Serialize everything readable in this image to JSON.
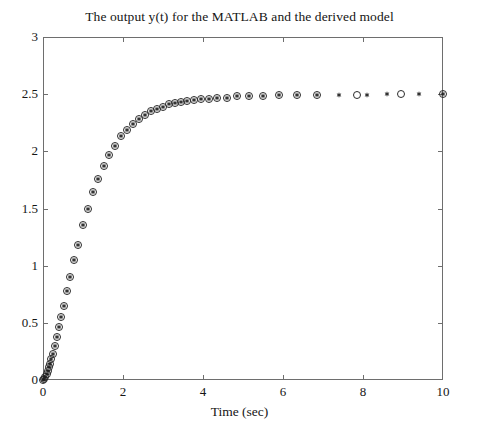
{
  "figure": {
    "background_color": "#ffffff",
    "axis_color": "#6e6e6e",
    "marker_color": "#2b2b2b"
  },
  "chart_data": {
    "type": "scatter",
    "title": "The output y(t) for the MATLAB and the derived model",
    "xlabel": "Time (sec)",
    "ylabel": "",
    "xlim": [
      0,
      10
    ],
    "ylim": [
      0,
      3
    ],
    "xticks": [
      0,
      2,
      4,
      6,
      8,
      10
    ],
    "xticklabels": [
      "0",
      "2",
      "4",
      "6",
      "8",
      "10"
    ],
    "yticks": [
      0,
      0.5,
      1,
      1.5,
      2,
      2.5,
      3
    ],
    "yticklabels": [
      "0",
      "0.5",
      "1",
      "1.5",
      "2",
      "2.5",
      "3"
    ],
    "grid": false,
    "legend": null,
    "legend_position": "none",
    "steady_state_value": 2.5,
    "series": [
      {
        "name": "MATLAB model",
        "marker": "o",
        "marker_style": "open-circle",
        "color": "#2b2b2b",
        "x": [
          0,
          0.03,
          0.06,
          0.09,
          0.12,
          0.15,
          0.18,
          0.21,
          0.25,
          0.3,
          0.35,
          0.4,
          0.46,
          0.52,
          0.6,
          0.68,
          0.78,
          0.88,
          1.0,
          1.12,
          1.25,
          1.38,
          1.52,
          1.66,
          1.8,
          1.95,
          2.1,
          2.25,
          2.4,
          2.55,
          2.7,
          2.85,
          3.0,
          3.15,
          3.3,
          3.45,
          3.6,
          3.78,
          3.95,
          4.15,
          4.35,
          4.6,
          4.85,
          5.15,
          5.5,
          5.9,
          6.35,
          6.85,
          7.85,
          8.95,
          10.0
        ],
        "y": [
          0.0,
          0.01,
          0.03,
          0.05,
          0.08,
          0.11,
          0.14,
          0.18,
          0.23,
          0.3,
          0.38,
          0.46,
          0.55,
          0.65,
          0.78,
          0.9,
          1.05,
          1.18,
          1.36,
          1.5,
          1.64,
          1.76,
          1.87,
          1.97,
          2.05,
          2.13,
          2.19,
          2.24,
          2.28,
          2.32,
          2.35,
          2.37,
          2.39,
          2.41,
          2.42,
          2.43,
          2.44,
          2.45,
          2.46,
          2.46,
          2.47,
          2.47,
          2.48,
          2.48,
          2.48,
          2.49,
          2.49,
          2.49,
          2.49,
          2.5,
          2.5
        ]
      },
      {
        "name": "Derived model",
        "marker": "*",
        "marker_style": "asterisk",
        "color": "#1c1c1c",
        "x": [
          0,
          0.03,
          0.06,
          0.09,
          0.12,
          0.15,
          0.18,
          0.21,
          0.25,
          0.3,
          0.35,
          0.4,
          0.46,
          0.52,
          0.6,
          0.68,
          0.78,
          0.88,
          1.0,
          1.12,
          1.25,
          1.38,
          1.52,
          1.66,
          1.8,
          1.95,
          2.1,
          2.25,
          2.4,
          2.55,
          2.7,
          2.85,
          3.0,
          3.15,
          3.3,
          3.45,
          3.6,
          3.78,
          3.95,
          4.15,
          4.35,
          4.6,
          4.85,
          5.15,
          5.5,
          5.9,
          6.35,
          6.85,
          7.4,
          8.1,
          8.6,
          9.4,
          10.0
        ],
        "y": [
          0.0,
          0.01,
          0.03,
          0.05,
          0.08,
          0.11,
          0.14,
          0.18,
          0.23,
          0.3,
          0.38,
          0.46,
          0.55,
          0.65,
          0.78,
          0.9,
          1.05,
          1.18,
          1.36,
          1.5,
          1.64,
          1.76,
          1.87,
          1.97,
          2.05,
          2.13,
          2.19,
          2.24,
          2.28,
          2.32,
          2.35,
          2.37,
          2.39,
          2.41,
          2.42,
          2.43,
          2.44,
          2.45,
          2.46,
          2.46,
          2.47,
          2.47,
          2.48,
          2.48,
          2.48,
          2.49,
          2.49,
          2.49,
          2.49,
          2.49,
          2.5,
          2.5,
          2.5
        ]
      }
    ]
  }
}
